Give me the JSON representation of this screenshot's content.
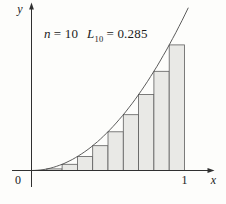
{
  "figure": {
    "annotation": {
      "n_var": "n",
      "n_value": "= 10",
      "sum_var": "L",
      "sum_subscript": "10",
      "sum_value": "= 0.285"
    },
    "axes": {
      "y_label": "y",
      "x_label": "x",
      "origin_label": "0",
      "x_max_label": "1"
    }
  },
  "colors": {
    "background": "#fdfdfb",
    "rect_fill": "#e9e9e6",
    "rect_stroke": "#5e5e5e",
    "curve_stroke": "#4a4a4a",
    "axis_stroke": "#303030",
    "text": "#1b1b1b"
  },
  "chart_data": {
    "type": "area",
    "function": "y = x^2",
    "method": "left-endpoint Riemann sum",
    "interval": [
      0,
      1
    ],
    "n": 10,
    "approximation_symbol": "L10",
    "approximation_value": 0.285,
    "rect_width": 0.1,
    "left_endpoints": [
      0,
      0.1,
      0.2,
      0.3,
      0.4,
      0.5,
      0.6,
      0.7,
      0.8,
      0.9
    ],
    "rect_heights": [
      0,
      0.01,
      0.04,
      0.09,
      0.16,
      0.25,
      0.36,
      0.49,
      0.64,
      0.81
    ],
    "xlabel": "x",
    "ylabel": "y",
    "x_tick_labels": [
      "0",
      "1"
    ],
    "xlim": [
      0,
      1.18
    ],
    "ylim": [
      0,
      1.1
    ],
    "grid": false,
    "legend": false,
    "curve_draw_range": [
      0,
      1.025
    ]
  }
}
